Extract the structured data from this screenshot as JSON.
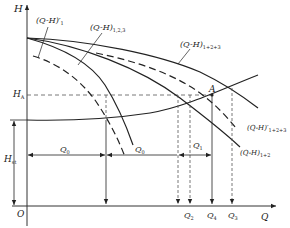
{
  "diagram": {
    "axes": {
      "y_label": "H",
      "x_label": "Q",
      "origin_label": "O"
    },
    "head_labels": {
      "h_a": {
        "main": "H",
        "sub": "A"
      },
      "h_st": {
        "main": "H",
        "sub": "st"
      }
    },
    "point_label": "A",
    "curves": [
      {
        "id": "qh-prime-1",
        "main": "(Q-H)",
        "prime": "′",
        "sub": "1",
        "style": "dashed"
      },
      {
        "id": "qh-123",
        "main": "(Q-H)",
        "prime": "",
        "sub": "1,2,3",
        "style": "solid"
      },
      {
        "id": "qh-1p2p3",
        "main": "(Q-H)",
        "prime": "",
        "sub": "1+2+3",
        "style": "solid"
      },
      {
        "id": "qh-prime-1p2p3",
        "main": "(Q-H)",
        "prime": "′",
        "sub": "1+2+3",
        "style": "dashed"
      },
      {
        "id": "qh-1p2",
        "main": "(Q-H)",
        "prime": "",
        "sub": "1+2",
        "style": "solid"
      }
    ],
    "flow_spans": {
      "left": {
        "main": "Q",
        "sub": "0"
      },
      "middle": {
        "main": "Q",
        "sub": "0"
      },
      "right": {
        "main": "Q",
        "sub": "1"
      }
    },
    "x_ticks": [
      {
        "main": "Q",
        "sub": "2"
      },
      {
        "main": "Q",
        "sub": "4"
      },
      {
        "main": "Q",
        "sub": "3"
      }
    ],
    "colors": {
      "line": "#222222",
      "dashed_guide": "#555555",
      "background": "#ffffff"
    }
  }
}
